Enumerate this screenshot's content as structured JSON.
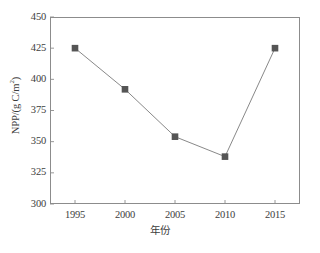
{
  "chart_data": {
    "type": "line",
    "title": "",
    "subtitle": "",
    "xlabel": "年份",
    "ylabel": "NPP/(g C/m2)",
    "ylabel_base": "NPP/(g C/m",
    "ylabel_exponent": "2",
    "ylabel_tail": ")",
    "x": [
      1995,
      2000,
      2005,
      2010,
      2015
    ],
    "categories": [
      "1995",
      "2000",
      "2005",
      "2010",
      "2015"
    ],
    "values": [
      425,
      392,
      354,
      338,
      425
    ],
    "series": [
      {
        "name": "NPP",
        "values": [
          425,
          392,
          354,
          338,
          425
        ]
      }
    ],
    "xlim": [
      1992.5,
      2017.5
    ],
    "ylim": [
      300,
      450
    ],
    "ytick_labels": [
      "450",
      "425",
      "400",
      "375",
      "350",
      "325",
      "300"
    ],
    "ytick_values": [
      450,
      425,
      400,
      375,
      350,
      325,
      300
    ],
    "xtick_labels": [
      "1995",
      "2000",
      "2005",
      "2010",
      "2015"
    ],
    "xtick_values": [
      1995,
      2000,
      2005,
      2010,
      2015
    ],
    "grid": false,
    "legend": false,
    "legend_position": "none",
    "marker": "square",
    "marker_color": "#555555",
    "line_color": "#7a7a7a",
    "axis_color": "#8c8c8c",
    "background_color": "#ffffff",
    "annotations": []
  }
}
